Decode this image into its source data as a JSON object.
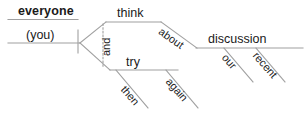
{
  "diagram": {
    "type": "reed-kellogg-sentence-diagram",
    "sentence": "everyone (you) think and try about again then discussion our recent",
    "background_color": "#ffffff",
    "line_color": "#a0a0a0",
    "text_color": "#1a1a1a",
    "words": {
      "subject": "everyone",
      "subject_alt": "(you)",
      "verb_upper": "think",
      "verb_lower": "try",
      "conjunction": "and",
      "preposition": "about",
      "object": "discussion",
      "modifier_our": "our",
      "modifier_recent": "recent",
      "modifier_again": "again",
      "modifier_then": "then"
    }
  }
}
